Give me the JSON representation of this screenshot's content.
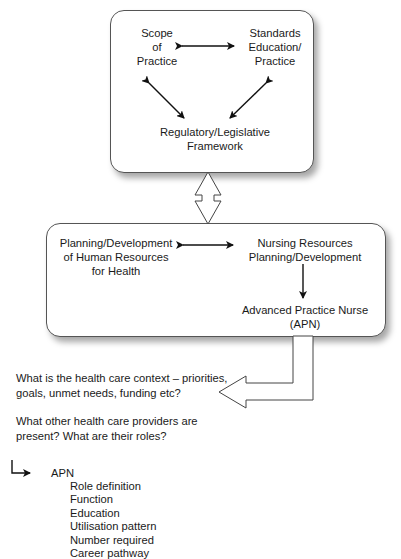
{
  "top_box": {
    "scope": [
      "Scope",
      "of",
      "Practice"
    ],
    "standards": [
      "Standards",
      "Education/",
      "Practice"
    ],
    "regulatory": [
      "Regulatory/Legislative",
      "Framework"
    ]
  },
  "bottom_box": {
    "planning_hr": [
      "Planning/Development",
      "of Human Resources",
      "for Health"
    ],
    "nursing": [
      "Nursing Resources",
      "Planning/Development"
    ],
    "apn": [
      "Advanced Practice Nurse",
      "(APN)"
    ]
  },
  "questions": {
    "context": [
      "What is the health care context – priorities,",
      "goals, unmet needs, funding etc?"
    ],
    "providers": [
      "What other health care providers are",
      "present? What are their roles?"
    ]
  },
  "apn_list": {
    "title": "APN",
    "items": [
      "Role definition",
      "Function",
      "Education",
      "Utilisation pattern",
      "Number required",
      "Career pathway"
    ]
  }
}
